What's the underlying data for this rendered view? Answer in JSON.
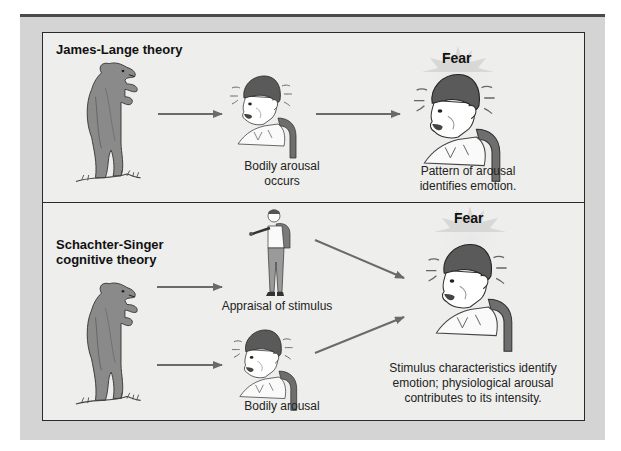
{
  "diagram": {
    "panels": [
      {
        "title": "James-Lange theory",
        "nodes": [
          {
            "id": "bear",
            "icon": "bear-icon",
            "label": ""
          },
          {
            "id": "arousal",
            "icon": "frightened-boy-icon",
            "label_lines": [
              "Bodily arousal",
              "occurs"
            ]
          },
          {
            "id": "emotion",
            "icon": "fearful-boy-icon",
            "heading": "Fear",
            "label_lines": [
              "Pattern of arousal",
              "identifies emotion."
            ]
          }
        ],
        "edges": [
          {
            "from": "bear",
            "to": "arousal"
          },
          {
            "from": "arousal",
            "to": "emotion"
          }
        ]
      },
      {
        "title_lines": [
          "Schachter-Singer",
          "cognitive theory"
        ],
        "nodes": [
          {
            "id": "bear",
            "icon": "bear-icon",
            "label": ""
          },
          {
            "id": "appraisal",
            "icon": "hiker-pointing-icon",
            "label": "Appraisal of stimulus"
          },
          {
            "id": "arousal",
            "icon": "frightened-boy-icon",
            "label": "Bodily arousal"
          },
          {
            "id": "emotion",
            "icon": "fearful-boy-icon",
            "heading": "Fear",
            "label_lines": [
              "Stimulus characteristics identify",
              "emotion; physiological arousal",
              "contributes to its intensity."
            ]
          }
        ],
        "edges": [
          {
            "from": "bear",
            "to": "appraisal"
          },
          {
            "from": "bear",
            "to": "arousal"
          },
          {
            "from": "appraisal",
            "to": "emotion"
          },
          {
            "from": "arousal",
            "to": "emotion"
          }
        ]
      }
    ],
    "colors": {
      "frame": "#d4d4d4",
      "panel": "#eeeeec",
      "border": "#2a2a2a",
      "arrow": "#6a6a6a",
      "bear": "#8a8a8a",
      "hair": "#5a5a5a",
      "backpack": "#6e6e6e",
      "glow": "#c8c8c8"
    }
  }
}
